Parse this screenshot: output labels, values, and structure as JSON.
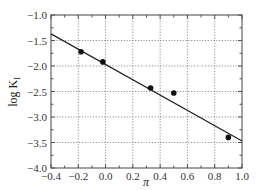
{
  "chart_data": {
    "type": "scatter",
    "title": "",
    "xlabel": "π",
    "ylabel": "log K_I",
    "xlim": [
      -0.4,
      1.0
    ],
    "ylim": [
      -4.0,
      -1.0
    ],
    "x_ticks": [
      "-0.4",
      "-0.2",
      "0.0",
      "0.2",
      "0.4",
      "0.6",
      "0.8",
      "1.0"
    ],
    "y_ticks": [
      "-1.0",
      "-1.5",
      "-2.0",
      "-2.5",
      "-3.0",
      "-3.5",
      "-4.0"
    ],
    "grid": true,
    "legend": null,
    "series": [
      {
        "name": "data",
        "kind": "scatter",
        "x": [
          -0.18,
          -0.02,
          0.33,
          0.5,
          0.9
        ],
        "y": [
          -1.72,
          -1.92,
          -2.43,
          -2.53,
          -3.4
        ]
      },
      {
        "name": "linear fit",
        "kind": "line",
        "x": [
          -0.4,
          1.0
        ],
        "y": [
          -1.37,
          -3.47
        ]
      }
    ]
  },
  "labels": {
    "xlabel": "π",
    "ylabel_main": "log K",
    "ylabel_sub": "I"
  },
  "colors": {
    "points": "#111111",
    "line": "#222222",
    "grid": "#777777",
    "frame": "#444444"
  }
}
